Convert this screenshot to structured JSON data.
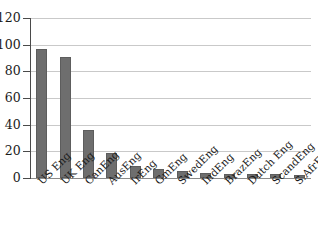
{
  "chart_data": {
    "type": "bar",
    "title": "",
    "subtitle": "",
    "xlabel": "",
    "ylabel": "",
    "ylim": [
      0,
      120
    ],
    "yticks": [
      0,
      20,
      40,
      60,
      80,
      100,
      120
    ],
    "grid": true,
    "legend": "none",
    "orientation": "vertical",
    "bar_color": "#6e6e6e",
    "categories": [
      "US Eng",
      "UK Eng",
      "CanEng",
      "AusEng",
      "IrEng",
      "GmEng",
      "SwedEng",
      "IndEng",
      "BrazEng",
      "Dutch Eng",
      "ScandEng",
      "S.AfrEng"
    ],
    "values": [
      97,
      91,
      36,
      19,
      9,
      7,
      5,
      4,
      3,
      3,
      3,
      2
    ]
  }
}
